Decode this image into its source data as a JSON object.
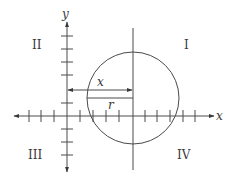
{
  "diagram": {
    "axes": {
      "x_label": "x",
      "y_label": "y"
    },
    "quadrants": {
      "q1": "I",
      "q2": "II",
      "q3": "III",
      "q4": "IV"
    },
    "segments": {
      "x_label": "x",
      "r_label": "r"
    },
    "colors": {
      "line": "#4a4a4a",
      "text": "#3a3a3a",
      "background": "#ffffff"
    }
  }
}
